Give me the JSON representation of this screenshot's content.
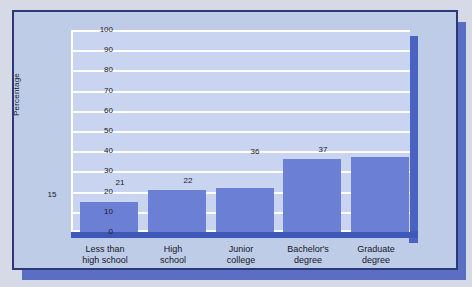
{
  "chart_data": {
    "type": "bar",
    "title": "",
    "xlabel": "",
    "ylabel": "Percentage",
    "categories": [
      "Less than\nhigh school",
      "High\nschool",
      "Junior\ncollege",
      "Bachelor's\ndegree",
      "Graduate\ndegree"
    ],
    "category_lines": [
      [
        "Less than",
        "high school"
      ],
      [
        "High",
        "school"
      ],
      [
        "Junior",
        "college"
      ],
      [
        "Bachelor's",
        "degree"
      ],
      [
        "Graduate",
        "degree"
      ]
    ],
    "values": [
      15,
      21,
      22,
      36,
      37
    ],
    "value_labels": [
      "15",
      "21",
      "22",
      "36",
      "37"
    ],
    "ylim": [
      0,
      100
    ],
    "ytick_step": 10,
    "yticks": [
      "100",
      "90",
      "80",
      "70",
      "60",
      "50",
      "40",
      "30",
      "20",
      "10",
      "0"
    ],
    "grid": true,
    "legend": false,
    "legend_position": "none",
    "colors": {
      "bar_fill": "#6b7fd5",
      "plot_background": "#c9d4f0",
      "panel_background": "#bfcce8",
      "gridline": "#ffffff",
      "axis_side_face": "#4a63c0",
      "axis_base_face": "#3e58b8",
      "panel_border": "#2b3a77",
      "drop_shadow": "#5a6fc4",
      "page_background": "#d6dae6",
      "text": "#15171f"
    }
  }
}
